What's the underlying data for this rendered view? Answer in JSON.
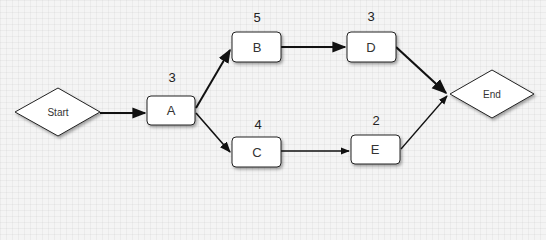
{
  "diagram": {
    "type": "activity-network",
    "colors": {
      "background": "#f4f4f4",
      "node_fill": "#ffffff",
      "node_stroke": "#222222",
      "edge": "#111111"
    },
    "nodes": {
      "start": {
        "label": "Start",
        "shape": "diamond"
      },
      "A": {
        "label": "A",
        "duration": "3",
        "shape": "rounded-rect"
      },
      "B": {
        "label": "B",
        "duration": "5",
        "shape": "rounded-rect"
      },
      "C": {
        "label": "C",
        "duration": "4",
        "shape": "rounded-rect"
      },
      "D": {
        "label": "D",
        "duration": "3",
        "shape": "rounded-rect"
      },
      "E": {
        "label": "E",
        "duration": "2",
        "shape": "rounded-rect"
      },
      "end": {
        "label": "End",
        "shape": "diamond"
      }
    },
    "edges": [
      {
        "from": "Start",
        "to": "A"
      },
      {
        "from": "A",
        "to": "B"
      },
      {
        "from": "A",
        "to": "C"
      },
      {
        "from": "B",
        "to": "D"
      },
      {
        "from": "C",
        "to": "E"
      },
      {
        "from": "D",
        "to": "End"
      },
      {
        "from": "E",
        "to": "End"
      }
    ]
  }
}
